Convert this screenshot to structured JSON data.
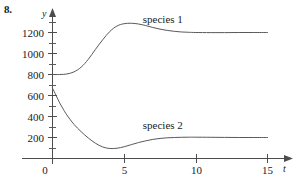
{
  "figure": {
    "problem_number": "8."
  },
  "chart_data": {
    "type": "line",
    "title": "",
    "subtitle": "",
    "xlabel": "t",
    "ylabel": "y",
    "grid": false,
    "legend_position": "inline-annotation",
    "xlim": [
      0,
      15.6
    ],
    "ylim": [
      0,
      1360
    ],
    "x_ticks": [
      0,
      5,
      10,
      15
    ],
    "x_tick_labels": [
      "0",
      "5",
      "10",
      "15"
    ],
    "y_ticks": [
      200,
      400,
      600,
      800,
      1000,
      1200
    ],
    "y_tick_labels": [
      "200",
      "400",
      "600",
      "800",
      "1000",
      "1200"
    ],
    "y_minor_ticks": [
      100,
      300,
      500,
      700,
      900,
      1100,
      1300
    ],
    "annotations": [
      {
        "text": "species 1",
        "x": 6.3,
        "y": 1295
      },
      {
        "text": "species 2",
        "x": 6.3,
        "y": 285
      }
    ],
    "series": [
      {
        "name": "species 1",
        "x": [
          0,
          0.5,
          1,
          1.5,
          2,
          2.5,
          3,
          3.5,
          4,
          4.5,
          5,
          5.5,
          6,
          6.5,
          7,
          7.5,
          8,
          8.5,
          9,
          9.5,
          10,
          11,
          12,
          13,
          14,
          15
        ],
        "values": [
          800,
          800,
          805,
          825,
          870,
          945,
          1040,
          1130,
          1210,
          1262,
          1284,
          1288,
          1281,
          1266,
          1248,
          1232,
          1220,
          1211,
          1205,
          1202,
          1200,
          1199,
          1199,
          1200,
          1200,
          1200
        ]
      },
      {
        "name": "species 2",
        "x": [
          0,
          0.25,
          0.5,
          0.75,
          1,
          1.5,
          2,
          2.5,
          3,
          3.5,
          4,
          4.5,
          5,
          5.5,
          6,
          6.5,
          7,
          7.5,
          8,
          8.5,
          9,
          9.5,
          10,
          11,
          12,
          13,
          14,
          15
        ],
        "values": [
          670,
          600,
          530,
          470,
          415,
          325,
          255,
          195,
          145,
          110,
          95,
          98,
          112,
          132,
          152,
          168,
          182,
          191,
          197,
          200,
          202,
          203,
          203,
          202,
          201,
          200,
          200,
          200
        ]
      }
    ]
  }
}
